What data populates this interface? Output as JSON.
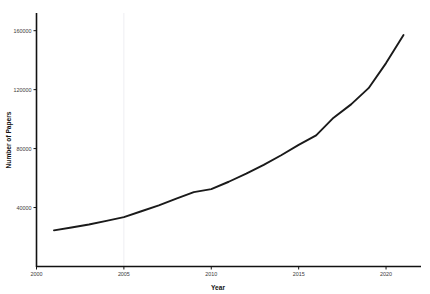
{
  "chart_data": {
    "type": "line",
    "title": "",
    "subtitle": "",
    "xlabel": "Year",
    "ylabel": "Number of Papers",
    "xlim": [
      2000,
      2022
    ],
    "ylim": [
      0,
      172000
    ],
    "xticks": [
      2000,
      2005,
      2010,
      2015,
      2020
    ],
    "xtick_labels": [
      "2000",
      "2005",
      "2010",
      "2015",
      "2020"
    ],
    "yticks": [
      40000,
      80000,
      120000,
      160000
    ],
    "ytick_labels": [
      "40000",
      "80000",
      "120000",
      "160000"
    ],
    "grid": false,
    "legend": null,
    "legend_position": "none",
    "line_color": "#1a1a1a",
    "line_width": 1.9,
    "background_color": "#ffffff",
    "series": [
      {
        "name": "Number of Papers",
        "x": [
          2001,
          2002,
          2003,
          2004,
          2005,
          2006,
          2007,
          2008,
          2009,
          2010,
          2011,
          2012,
          2013,
          2014,
          2015,
          2016,
          2017,
          2018,
          2019,
          2020,
          2021
        ],
        "values": [
          24500,
          26500,
          28500,
          31000,
          33500,
          37500,
          41500,
          46000,
          50500,
          52500,
          57500,
          63000,
          69000,
          75500,
          82500,
          89000,
          101000,
          110000,
          121000,
          138000,
          157000
        ]
      }
    ]
  },
  "axes": {
    "x_axis_label": "Year",
    "y_axis_label": "Number of Papers"
  }
}
